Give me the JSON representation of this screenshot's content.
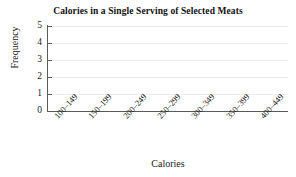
{
  "chart_data": {
    "type": "bar",
    "title": "Calories in a Single Serving of Selected Meats",
    "xlabel": "Calories",
    "ylabel": "Frequency",
    "categories": [
      "100–149",
      "150–199",
      "200–249",
      "250–299",
      "300–349",
      "350–399",
      "400–449"
    ],
    "values": [
      0,
      0,
      0,
      0,
      0,
      0,
      0
    ],
    "ylim": [
      0,
      5
    ],
    "yticks": [
      "0",
      "1",
      "2",
      "3",
      "4",
      "5"
    ],
    "grid": "horizontal",
    "legend": "none",
    "colors": {
      "axis": "#5a5a5a",
      "grid": "#ececec",
      "text": "#1a1a1a",
      "background": "#ffffff",
      "bar": "#6d6d6d"
    }
  },
  "ytick_labels": [
    {
      "value": "5"
    },
    {
      "value": "4"
    },
    {
      "value": "3"
    },
    {
      "value": "2"
    },
    {
      "value": "1"
    },
    {
      "value": "0"
    }
  ],
  "xtick_labels": [
    {
      "value": "100–149"
    },
    {
      "value": "150–199"
    },
    {
      "value": "200–249"
    },
    {
      "value": "250–299"
    },
    {
      "value": "300–349"
    },
    {
      "value": "350–399"
    },
    {
      "value": "400–449"
    }
  ]
}
